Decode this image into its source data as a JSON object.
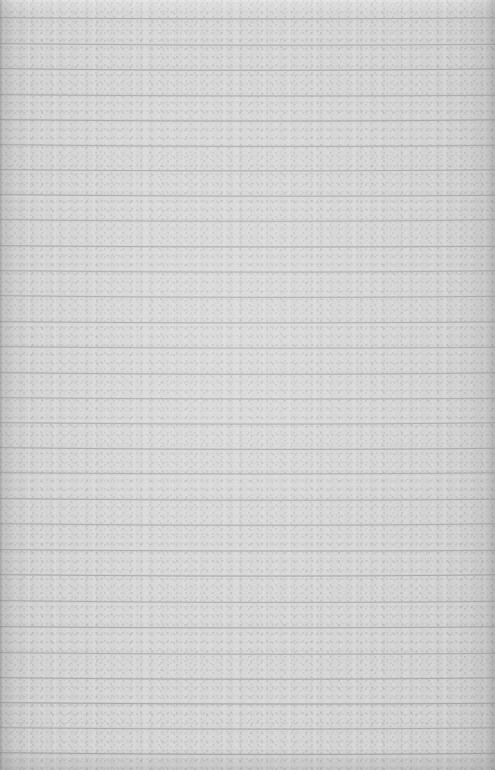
{
  "document": {
    "kind": "lined-notebook-paper",
    "description": "Blank scanned sheet of ruled notebook paper",
    "has_handwriting": false,
    "has_text": false,
    "page_width": 495,
    "page_height": 770,
    "orientation": "portrait"
  },
  "paper": {
    "base_color": "#d3d3d3",
    "highlight_color": "#dcdcdc",
    "shadow_color": "#c2c2c2",
    "texture": "fibrous grain with faint horizontal streaking",
    "left_edge_shadow_color": "#9a9a9a",
    "right_edge_shadow_color": "#b0b0b0"
  },
  "ruling": {
    "style": "horizontal ruled lines, full bleed, no vertical margin rule",
    "line_color": "#a6a6aa",
    "line_color_light": "#b4b4b8",
    "line_thickness": 1,
    "spacing": 25.3,
    "first_line_y": 18,
    "last_line_y": 753,
    "line_count": 30,
    "waviness": "slight sag toward centre from page curl",
    "line_y_positions": [
      18,
      44,
      69,
      95,
      120,
      145,
      170,
      195,
      220,
      246,
      271,
      296,
      322,
      347,
      373,
      398,
      423,
      448,
      473,
      499,
      524,
      550,
      575,
      601,
      627,
      653,
      678,
      703,
      728,
      753
    ]
  },
  "content": {
    "writing": [],
    "margin_notes": [],
    "page_number": ""
  }
}
